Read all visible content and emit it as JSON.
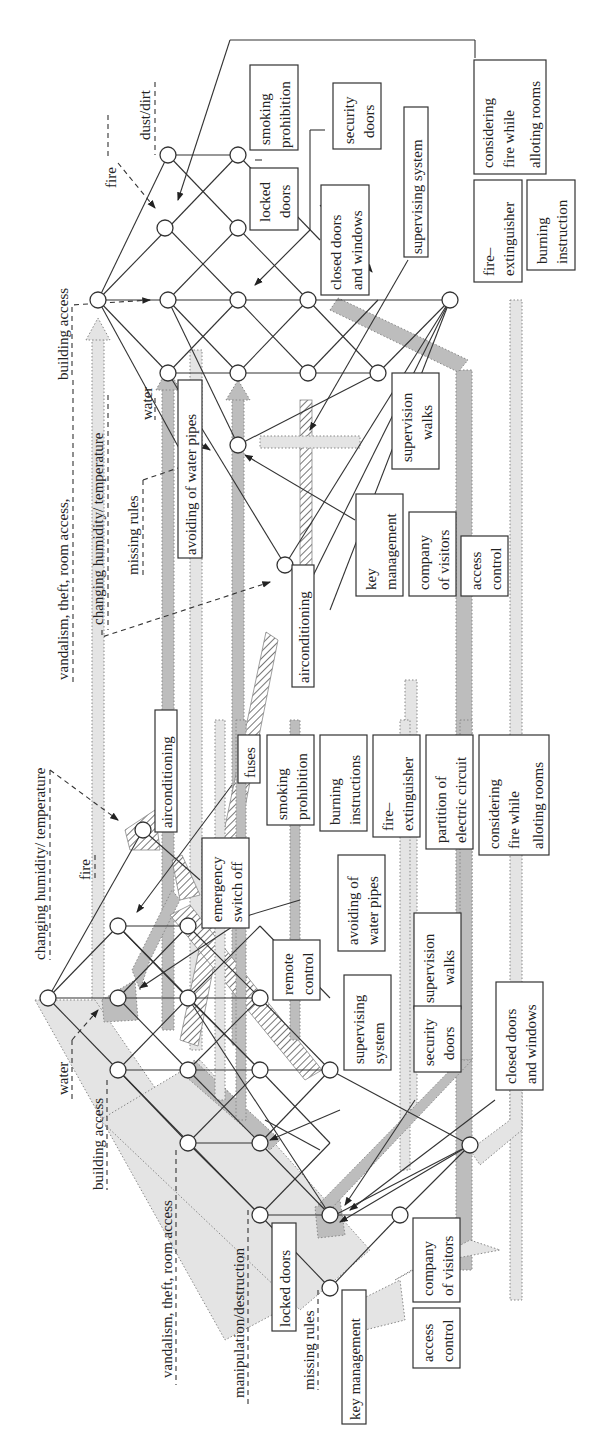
{
  "figure": {
    "orientation": "rotated-90-ccw",
    "top_lattice": {
      "threat_labels": [
        {
          "id": "dust",
          "text": "dust/dirt"
        },
        {
          "id": "fire",
          "text": "fire"
        },
        {
          "id": "building",
          "text": "building access"
        },
        {
          "id": "vandal",
          "text": "vandalism,  theft,  room access,"
        },
        {
          "id": "humidity",
          "text": "changing humidity/ temperature"
        },
        {
          "id": "missing",
          "text": "missing rules"
        },
        {
          "id": "water",
          "text": "water"
        }
      ],
      "measure_boxes": [
        {
          "id": "smoking",
          "lines": [
            "smoking",
            "prohibition"
          ]
        },
        {
          "id": "locked",
          "lines": [
            "locked",
            "doors"
          ]
        },
        {
          "id": "secdoors",
          "lines": [
            "security",
            "doors"
          ]
        },
        {
          "id": "closed",
          "lines": [
            "closed doors",
            "and windows"
          ]
        },
        {
          "id": "supsys",
          "lines": [
            "supervising system"
          ]
        },
        {
          "id": "considering",
          "lines": [
            "considering",
            "fire while",
            "alloting rooms"
          ]
        },
        {
          "id": "fireext",
          "lines": [
            "fire–",
            "extinguisher"
          ]
        },
        {
          "id": "burning",
          "lines": [
            "burning",
            "instruction"
          ]
        },
        {
          "id": "avoiding",
          "lines": [
            "avoiding of water pipes"
          ]
        },
        {
          "id": "supwalks",
          "lines": [
            "supervision",
            "walks"
          ]
        },
        {
          "id": "keymgmt",
          "lines": [
            "key",
            "management"
          ]
        },
        {
          "id": "company",
          "lines": [
            "company",
            "of visitors"
          ]
        },
        {
          "id": "access",
          "lines": [
            "access",
            "control"
          ]
        },
        {
          "id": "aircon",
          "lines": [
            "airconditioning"
          ]
        }
      ]
    },
    "bottom_lattice": {
      "threat_labels": [
        {
          "id": "humidity",
          "text": "changing humidity/ temperature"
        },
        {
          "id": "fire",
          "text": "fire"
        },
        {
          "id": "water",
          "text": "water"
        },
        {
          "id": "building",
          "text": "building access"
        },
        {
          "id": "vandal",
          "text": "vandalism,  theft,  room access"
        },
        {
          "id": "manip",
          "text": "manipulation/destruction"
        },
        {
          "id": "missing",
          "text": "missing rules"
        }
      ],
      "measure_boxes": [
        {
          "id": "aircon",
          "lines": [
            "airconditioning"
          ]
        },
        {
          "id": "fuses",
          "lines": [
            "fuses"
          ]
        },
        {
          "id": "emergency",
          "lines": [
            "emergency",
            "switch off"
          ]
        },
        {
          "id": "smoking",
          "lines": [
            "smoking",
            "prohibition"
          ]
        },
        {
          "id": "burning",
          "lines": [
            "burning",
            "instructions"
          ]
        },
        {
          "id": "fireext",
          "lines": [
            "fire–",
            "extinguisher"
          ]
        },
        {
          "id": "partition",
          "lines": [
            "partition of",
            "electric circuit"
          ]
        },
        {
          "id": "considering",
          "lines": [
            "considering",
            "fire while",
            "alloting rooms"
          ]
        },
        {
          "id": "remote",
          "lines": [
            "remote",
            "control"
          ]
        },
        {
          "id": "avoiding",
          "lines": [
            "avoiding of",
            "water pipes"
          ]
        },
        {
          "id": "supsys",
          "lines": [
            "supervising",
            "system"
          ]
        },
        {
          "id": "supwalks",
          "lines": [
            "supervision",
            "walks"
          ]
        },
        {
          "id": "secdoors",
          "lines": [
            "security",
            "doors"
          ]
        },
        {
          "id": "closed",
          "lines": [
            "closed doors",
            "and windows"
          ]
        },
        {
          "id": "locked",
          "lines": [
            "locked doors"
          ]
        },
        {
          "id": "company",
          "lines": [
            "company",
            "of visitors"
          ]
        },
        {
          "id": "access",
          "lines": [
            "access",
            "control"
          ]
        },
        {
          "id": "keymgmt",
          "lines": [
            "key management"
          ]
        }
      ]
    }
  }
}
